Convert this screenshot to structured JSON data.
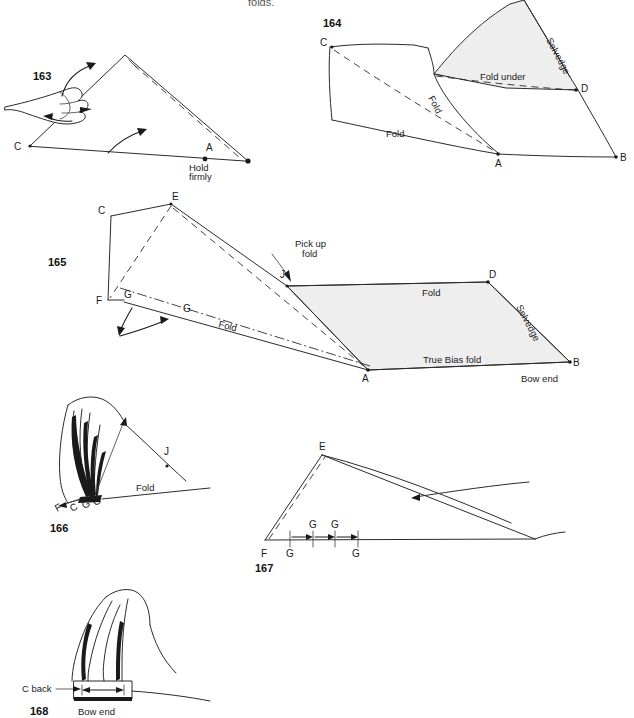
{
  "page": {
    "top_cut_text": "folds."
  },
  "figures": [
    {
      "number": "163",
      "caption_points": [
        "C",
        "A"
      ],
      "labels": [
        "Hold firmly"
      ],
      "hold_line1": "Hold",
      "hold_line2": "firmly",
      "point_c": "C",
      "point_a": "A"
    },
    {
      "number": "164",
      "point_c": "C",
      "point_a": "A",
      "point_b": "B",
      "point_d": "D",
      "label_fold_1": "Fold",
      "label_fold_2": "Fold",
      "label_fold_under": "Fold under",
      "label_selvedge": "Selvedge"
    },
    {
      "number": "165",
      "point_c": "C",
      "point_e": "E",
      "point_f": "F",
      "point_g1": "G",
      "point_g2": "G",
      "point_j": "J",
      "point_a": "A",
      "point_b": "B",
      "point_d": "D",
      "label_pickup_1": "Pick up",
      "label_pickup_2": "fold",
      "label_fold_left": "Fold",
      "label_fold_top": "Fold",
      "label_selvedge": "Selvedge",
      "label_true_bias": "True Bias fold",
      "label_bow_end": "Bow end"
    },
    {
      "number": "166",
      "point_f": "F",
      "point_c": "C",
      "point_g1": "G",
      "point_g2": "G",
      "point_j": "J",
      "label_fold": "Fold"
    },
    {
      "number": "167",
      "point_e": "E",
      "point_f": "F",
      "point_g_below_1": "G",
      "point_g_below_2": "G",
      "point_g_above_1": "G",
      "point_g_above_2": "G"
    },
    {
      "number": "168",
      "label_c_back": "C back",
      "label_bow_end": "Bow end"
    }
  ],
  "colors": {
    "ink": "#2b2b2b",
    "shade": "#eeeeee",
    "paper": "#ffffff"
  }
}
